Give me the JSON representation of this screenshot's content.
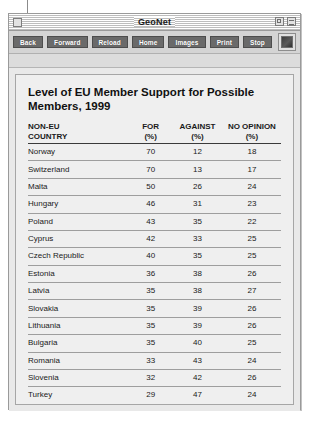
{
  "window": {
    "title": "GeoNet",
    "close_icon": "close-box",
    "zoom_icon": "zoom-box",
    "collapse_icon": "collapse-box"
  },
  "toolbar": {
    "buttons": [
      {
        "label": "Back",
        "name": "back-button"
      },
      {
        "label": "Forward",
        "name": "forward-button"
      },
      {
        "label": "Reload",
        "name": "reload-button"
      },
      {
        "label": "Home",
        "name": "home-button"
      },
      {
        "label": "Images",
        "name": "images-button"
      },
      {
        "label": "Print",
        "name": "print-button"
      },
      {
        "label": "Stop",
        "name": "stop-button"
      }
    ],
    "logo_icon": "browser-logo-icon"
  },
  "page": {
    "headline": "Level of EU Member Support for\nPossible Members, 1999",
    "source": "SOURCE: Standard Eurobarometer"
  },
  "chart_data": {
    "type": "table",
    "title": "Level of EU Member Support for Possible Members, 1999",
    "columns": [
      "NON-EU\nCOUNTRY",
      "FOR\n(%)",
      "AGAINST\n(%)",
      "NO OPINION\n(%)"
    ],
    "categories": [
      "Norway",
      "Switzerland",
      "Malta",
      "Hungary",
      "Poland",
      "Cyprus",
      "Czech Republic",
      "Estonia",
      "Latvia",
      "Slovakia",
      "Lithuania",
      "Bulgaria",
      "Romania",
      "Slovenia",
      "Turkey"
    ],
    "series": [
      {
        "name": "FOR (%)",
        "values": [
          70,
          70,
          50,
          46,
          43,
          42,
          40,
          36,
          35,
          35,
          35,
          35,
          33,
          32,
          29
        ]
      },
      {
        "name": "AGAINST (%)",
        "values": [
          12,
          13,
          26,
          31,
          35,
          33,
          35,
          38,
          38,
          39,
          39,
          40,
          43,
          42,
          47
        ]
      },
      {
        "name": "NO OPINION (%)",
        "values": [
          18,
          17,
          24,
          23,
          22,
          25,
          25,
          26,
          27,
          26,
          26,
          25,
          24,
          26,
          24
        ]
      }
    ],
    "rows": [
      {
        "country": "Norway",
        "for": 70,
        "against": 12,
        "no_opinion": 18
      },
      {
        "country": "Switzerland",
        "for": 70,
        "against": 13,
        "no_opinion": 17
      },
      {
        "country": "Malta",
        "for": 50,
        "against": 26,
        "no_opinion": 24
      },
      {
        "country": "Hungary",
        "for": 46,
        "against": 31,
        "no_opinion": 23
      },
      {
        "country": "Poland",
        "for": 43,
        "against": 35,
        "no_opinion": 22
      },
      {
        "country": "Cyprus",
        "for": 42,
        "against": 33,
        "no_opinion": 25
      },
      {
        "country": "Czech Republic",
        "for": 40,
        "against": 35,
        "no_opinion": 25
      },
      {
        "country": "Estonia",
        "for": 36,
        "against": 38,
        "no_opinion": 26
      },
      {
        "country": "Latvia",
        "for": 35,
        "against": 38,
        "no_opinion": 27
      },
      {
        "country": "Slovakia",
        "for": 35,
        "against": 39,
        "no_opinion": 26
      },
      {
        "country": "Lithuania",
        "for": 35,
        "against": 39,
        "no_opinion": 26
      },
      {
        "country": "Bulgaria",
        "for": 35,
        "against": 40,
        "no_opinion": 25
      },
      {
        "country": "Romania",
        "for": 33,
        "against": 43,
        "no_opinion": 24
      },
      {
        "country": "Slovenia",
        "for": 32,
        "against": 42,
        "no_opinion": 26
      },
      {
        "country": "Turkey",
        "for": 29,
        "against": 47,
        "no_opinion": 24
      }
    ],
    "source": "SOURCE: Standard Eurobarometer"
  }
}
